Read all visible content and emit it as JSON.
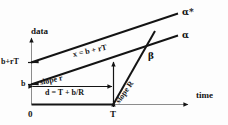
{
  "figure": {
    "type": "diagram",
    "axes": {
      "y_label": "data",
      "x_label": "time",
      "x_ticks": [
        "0",
        "T"
      ],
      "y_ticks": [
        "b+rT",
        "b"
      ]
    },
    "lines": [
      {
        "id": "alpha-star",
        "end_label": "α*",
        "equation_label": "x = b + rT",
        "start_y_label": "b+rT"
      },
      {
        "id": "alpha",
        "end_label": "α",
        "slope_label": "slope r",
        "start_y_label": "b"
      },
      {
        "id": "beta",
        "end_label": "β",
        "slope_label": "slope R",
        "start_x_label": "T"
      }
    ],
    "annotations": [
      {
        "id": "horizontal-distance",
        "text": "d = T + b/R"
      }
    ],
    "colors": {
      "ink": "#141414",
      "background": "#fdfdfd",
      "thin_rule": "#9a9a9a"
    }
  },
  "labels": {
    "data": "data",
    "time": "time",
    "zero": "0",
    "T": "T",
    "b_plus_rT": "b+rT",
    "b": "b",
    "x_equals": "x = b + rT",
    "slope_r": "slope r",
    "slope_R": "slope R",
    "d_equals": "d = T + b/R",
    "alpha_star": "α*",
    "alpha": "α",
    "beta": "β"
  }
}
